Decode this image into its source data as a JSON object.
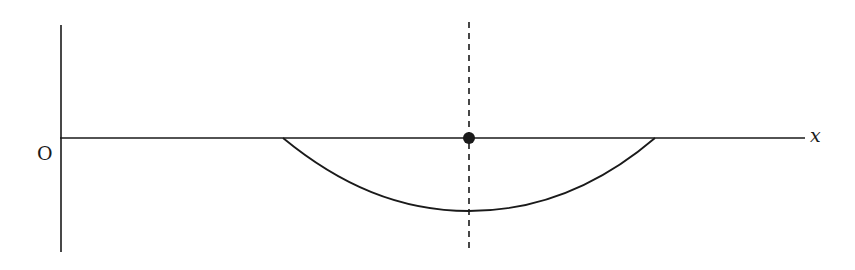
{
  "diagram": {
    "origin_label": "O",
    "x_axis_label": "x",
    "colors": {
      "line": "#1a1a1a",
      "background": "#ffffff"
    },
    "elements": {
      "vertical_axis": {
        "x": 60,
        "y1": 25,
        "y2": 252
      },
      "horizontal_axis": {
        "y": 138,
        "x1": 60,
        "x2": 805
      },
      "curve": {
        "start_x": 283,
        "end_x": 655,
        "min_x": 469,
        "min_y": 211
      },
      "dashed_line": {
        "x": 469,
        "y1": 22,
        "y2": 250
      },
      "point": {
        "x": 469,
        "y": 138
      }
    }
  }
}
